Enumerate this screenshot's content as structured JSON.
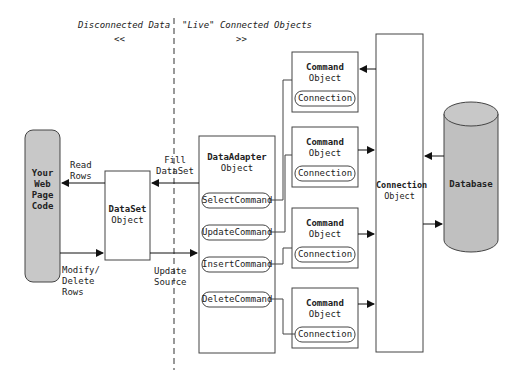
{
  "header": {
    "disconnected": "Disconnected Data",
    "disconnected_arrow": "<<",
    "connected": "\"Live\" Connected Objects",
    "connected_arrow": ">>"
  },
  "web_page": {
    "line1": "Your",
    "line2": "Web",
    "line3": "Page",
    "line4": "Code"
  },
  "read_rows": {
    "line1": "Read",
    "line2": "Rows"
  },
  "modify_rows": {
    "line1": "Modify/",
    "line2": "Delete",
    "line3": "Rows"
  },
  "dataset": {
    "title": "DataSet",
    "subtitle": "Object"
  },
  "fill": {
    "line1": "Fill",
    "line2": "DataSet"
  },
  "update": {
    "line1": "Update",
    "line2": "Source"
  },
  "dataadapter": {
    "title": "DataAdapter",
    "subtitle": "Object",
    "commands": [
      "SelectCommand",
      "UpdateCommand",
      "InsertCommand",
      "DeleteCommand"
    ]
  },
  "command_objects": [
    {
      "title": "Command",
      "subtitle": "Object",
      "connection": "Connection"
    },
    {
      "title": "Command",
      "subtitle": "Object",
      "connection": "Connection"
    },
    {
      "title": "Command",
      "subtitle": "Object",
      "connection": "Connection"
    },
    {
      "title": "Command",
      "subtitle": "Object",
      "connection": "Connection"
    }
  ],
  "connection_object": {
    "title": "Connection",
    "subtitle": "Object"
  },
  "database": {
    "label": "Database",
    "fill": "#c0c0c0"
  }
}
